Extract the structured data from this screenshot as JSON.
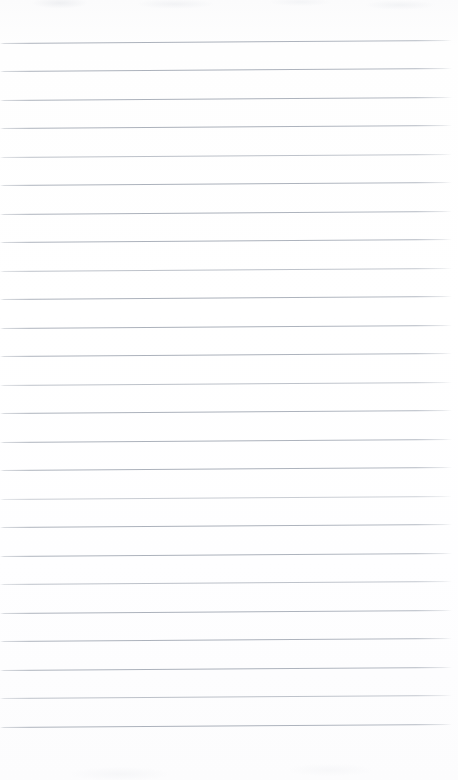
{
  "document": {
    "kind": "scanned-ruled-paper",
    "title": "Blank Ruled Notepad Page",
    "page_width": 458,
    "page_height": 780,
    "content_text": "",
    "has_handwriting": false,
    "has_printed_text": false,
    "orientation": "portrait"
  },
  "paper": {
    "background_color": "#fdfdfd",
    "edge_tint_color": "#fbfbfc",
    "top_margin_px": 43,
    "bottom_margin_px": 53,
    "left_margin_px": 0,
    "right_margin_px": 6
  },
  "ruling": {
    "line_color": "#aab0ba",
    "line_thickness_px": 1,
    "line_spacing_px": 28.5,
    "first_line_y": 43,
    "last_line_y": 727,
    "line_count": 25,
    "line_start_x": 0,
    "line_end_x": 452,
    "skew_degrees": -0.38,
    "style": "wide-ruled",
    "margin_rule": "none",
    "lines": [
      {
        "index": 1,
        "y": 43,
        "opacity": "normal"
      },
      {
        "index": 2,
        "y": 71,
        "opacity": "normal"
      },
      {
        "index": 3,
        "y": 100,
        "opacity": "normal"
      },
      {
        "index": 4,
        "y": 128,
        "opacity": "normal"
      },
      {
        "index": 5,
        "y": 157,
        "opacity": "faint"
      },
      {
        "index": 6,
        "y": 185,
        "opacity": "normal"
      },
      {
        "index": 7,
        "y": 214,
        "opacity": "normal"
      },
      {
        "index": 8,
        "y": 242,
        "opacity": "normal"
      },
      {
        "index": 9,
        "y": 271,
        "opacity": "faint"
      },
      {
        "index": 10,
        "y": 299,
        "opacity": "normal"
      },
      {
        "index": 11,
        "y": 328,
        "opacity": "normal"
      },
      {
        "index": 12,
        "y": 356,
        "opacity": "normal"
      },
      {
        "index": 13,
        "y": 385,
        "opacity": "faint"
      },
      {
        "index": 14,
        "y": 413,
        "opacity": "normal"
      },
      {
        "index": 15,
        "y": 442,
        "opacity": "normal"
      },
      {
        "index": 16,
        "y": 470,
        "opacity": "normal"
      },
      {
        "index": 17,
        "y": 499,
        "opacity": "fainter"
      },
      {
        "index": 18,
        "y": 527,
        "opacity": "normal"
      },
      {
        "index": 19,
        "y": 556,
        "opacity": "normal"
      },
      {
        "index": 20,
        "y": 584,
        "opacity": "faint"
      },
      {
        "index": 21,
        "y": 613,
        "opacity": "normal"
      },
      {
        "index": 22,
        "y": 641,
        "opacity": "normal"
      },
      {
        "index": 23,
        "y": 670,
        "opacity": "normal"
      },
      {
        "index": 24,
        "y": 698,
        "opacity": "faint"
      },
      {
        "index": 25,
        "y": 727,
        "opacity": "normal"
      }
    ]
  }
}
